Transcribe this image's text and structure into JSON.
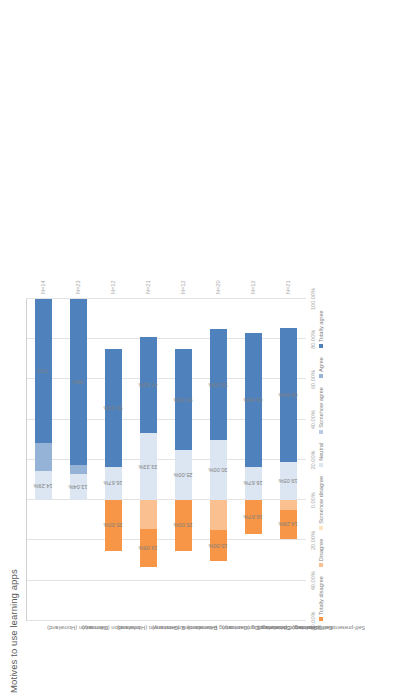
{
  "figure": {
    "orientation": "rotated-90",
    "background": "#ffffff"
  },
  "chart_data": [
    {
      "id": "motives",
      "type": "bar",
      "subtype": "diverging-stacked-likert",
      "title": "Motives to use learning apps",
      "xlabel": "",
      "ylabel": "",
      "grid": true,
      "legend_position": "bottom",
      "axis_ticks": [
        "60.00%",
        "40.00%",
        "20.00%",
        "0.00%",
        "20.00%",
        "40.00%",
        "60.00%",
        "80.00%",
        "100.00%"
      ],
      "axis_min": -60,
      "axis_max": 100,
      "categories": [
        "Information (Homeland)",
        "Information (Germany)",
        "Entertainment (Homeland)",
        "Entertainment (Germany)",
        "Socializing, Communicating (Homeland)",
        "Socializing, Communicating (Germany)",
        "Self-presentation (Homeland)",
        "Self-presentation (Germany)"
      ],
      "n_labels": [
        "N=14",
        "N=23",
        "N=12",
        "N=21",
        "N=12",
        "N=20",
        "N=12",
        "N=21"
      ],
      "legend": [
        {
          "label": "Totally disagree",
          "color": "#f79646"
        },
        {
          "label": "Disagree",
          "color": "#fac08f"
        },
        {
          "label": "Somehow disagree",
          "color": "#fde4c0"
        },
        {
          "label": "Neutral",
          "color": "#dce6f2"
        },
        {
          "label": "Somehow agree",
          "color": "#b8cce4"
        },
        {
          "label": "Agree",
          "color": "#95b3d7"
        },
        {
          "label": "Totally agree",
          "color": "#4f81bd"
        }
      ],
      "series": [
        {
          "name": "Totally disagree",
          "values": [
            0.0,
            0.0,
            25.0,
            19.05,
            25.0,
            15.0,
            16.67,
            14.29
          ],
          "labels": [
            "0.00%",
            "0.00%",
            "25.00%",
            "19.05%",
            "25.00%",
            "15.00%",
            "16.67%",
            "14.29%"
          ]
        },
        {
          "name": "Disagree",
          "values": [
            0.0,
            0.0,
            0.0,
            14.28,
            0.0,
            15.0,
            0.0,
            4.76
          ],
          "labels": [
            "",
            "",
            "",
            "",
            "",
            "",
            "",
            ""
          ]
        },
        {
          "name": "Somehow disagree",
          "values": [
            0.0,
            0.0,
            0.0,
            0.0,
            0.0,
            0.0,
            0.0,
            0.0
          ],
          "labels": [
            "",
            "",
            "",
            "",
            "",
            "",
            "",
            ""
          ]
        },
        {
          "name": "Neutral",
          "values": [
            14.29,
            13.04,
            16.67,
            33.33,
            25.0,
            30.0,
            16.67,
            19.05
          ],
          "labels": [
            "14.29%",
            "13.04%",
            "16.67%",
            "33.33%",
            "25.00%",
            "30.00%",
            "16.67%",
            "19.05%"
          ]
        },
        {
          "name": "Somehow agree",
          "values": [
            0.0,
            0.0,
            0.0,
            0.0,
            0.0,
            0.0,
            0.0,
            0.0
          ],
          "labels": [
            "",
            "",
            "",
            "",
            "",
            "",
            "",
            ""
          ]
        },
        {
          "name": "Agree",
          "values": [
            14.29,
            4.35,
            0.0,
            0.0,
            0.0,
            0.0,
            0.0,
            0.0
          ],
          "labels": [
            "",
            "",
            "",
            "",
            "",
            "",
            "",
            ""
          ]
        },
        {
          "name": "Totally agree",
          "values": [
            71.43,
            82.61,
            58.33,
            47.62,
            50.0,
            55.0,
            66.66,
            66.66
          ],
          "labels": [
            "71%",
            "86%",
            "58.33%",
            "47.62%",
            "50.00%",
            "55.00%",
            "66.66%",
            "66.66%"
          ]
        }
      ]
    },
    {
      "id": "usage-frequency",
      "type": "bar",
      "subtype": "stacked-100",
      "title": "Using learning apps",
      "xlabel": "",
      "ylabel": "",
      "grid": true,
      "legend_position": "bottom",
      "axis_ticks": [
        "0.00%",
        "10.00%",
        "20.00%",
        "30.00%",
        "40.00%",
        "50.00%",
        "60.00%",
        "70.00%",
        "80.00%",
        "90.00%",
        "100.00%"
      ],
      "axis_min": 0,
      "axis_max": 100,
      "categories": [
        "Homeland",
        "Germany"
      ],
      "n_labels": [
        "N=27",
        "N=28"
      ],
      "legend": [
        {
          "label": "Daily",
          "color": "#4f7f38"
        },
        {
          "label": "A few times a week",
          "color": "#6aa142"
        },
        {
          "label": "About once a week",
          "color": "#9bcb5a"
        },
        {
          "label": "A few times a month",
          "color": "#c3e08a"
        },
        {
          "label": "About once a month",
          "color": "#d9ecb4"
        },
        {
          "label": "A few times a year",
          "color": "#e9f4d6"
        },
        {
          "label": "Never",
          "color": "#f4faec"
        }
      ],
      "series": [
        {
          "name": "Daily",
          "values": [
            18.52,
            46.43
          ],
          "labels": [
            "18.52%",
            "46.43%"
          ]
        },
        {
          "name": "A few times a week",
          "values": [
            11.11,
            21.43
          ],
          "labels": [
            "11.11%",
            "21.43%"
          ]
        },
        {
          "name": "About once a week",
          "values": [
            7.41,
            17.86
          ],
          "labels": [
            "7.41%",
            "17.86%"
          ]
        },
        {
          "name": "A few times a month",
          "values": [
            11.11,
            3.57
          ],
          "labels": [
            "11.11%",
            "3.57%"
          ]
        },
        {
          "name": "About once a month",
          "values": [
            7.41,
            7.14
          ],
          "labels": [
            "7.41%",
            "7.14%"
          ]
        },
        {
          "name": "A few times a year",
          "values": [
            44.44,
            3.57
          ],
          "labels": [
            "44.44%",
            "3.57%"
          ]
        },
        {
          "name": "Never",
          "values": [
            0.0,
            0.0
          ],
          "labels": [
            "",
            ""
          ]
        }
      ]
    }
  ]
}
